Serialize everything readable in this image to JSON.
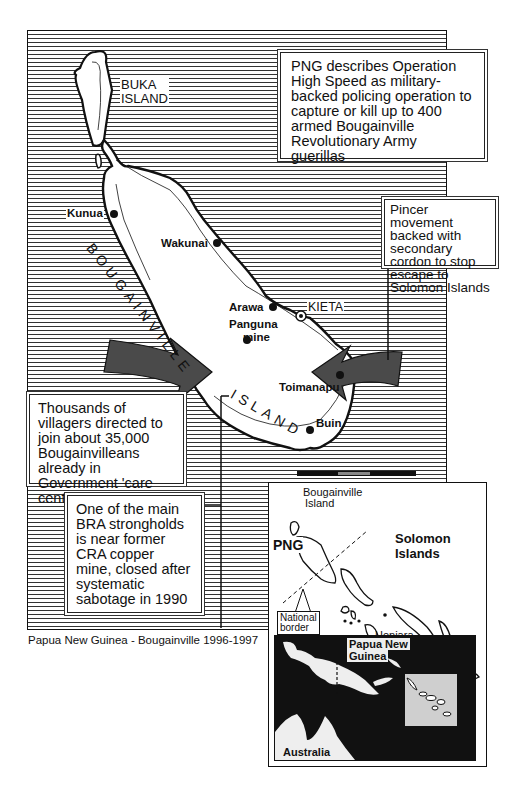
{
  "map": {
    "caption": "Papua New Guinea - Bougainville 1996-1997",
    "labels": {
      "buka_line1": "BUKA",
      "buka_line2": "ISLAND",
      "bougainville_island_word1": "BOUGAINVILLE",
      "bougainville_island_word2": "ISLAND",
      "kunua": "Kunua",
      "wakunai": "Wakunai",
      "arawa": "Arawa",
      "kieta": "KIETA",
      "panguna_line1": "Panguna",
      "panguna_line2": "mine",
      "toimanapu": "Toimanapu",
      "buin": "Buin"
    },
    "callouts": {
      "operation": "PNG describes Operation High Speed as military-backed policing operation to capture or kill up to 400 armed  Bougainville Revolutionary Army guerillas",
      "pincer": "Pincer movement backed with secondary cordon to stop escape to Solomon Islands",
      "villagers": "Thousands of villagers directed to join about 35,000 Bougainvilleans already in Government 'care centres'",
      "stronghold": "One of the main BRA strongholds is near former CRA copper mine, closed after systematic sabotage in 1990"
    },
    "colors": {
      "ink": "#111111",
      "paper": "#ffffff",
      "arrow_grey": "#555555"
    }
  },
  "inset": {
    "labels": {
      "bougainville_line1": "Bougainville",
      "bougainville_line2": "Island",
      "png": "PNG",
      "solomon_line1": "Solomon",
      "solomon_line2": "Islands",
      "border_line1": "National",
      "border_line2": "border",
      "honiara": "Honiara"
    },
    "locator": {
      "png_line1": "Papua New",
      "png_line2": "Guinea",
      "australia": "Australia"
    }
  }
}
